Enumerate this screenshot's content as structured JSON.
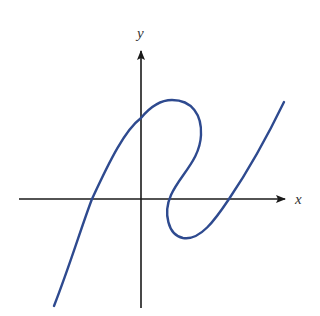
{
  "figure": {
    "x_axis_label": "x",
    "y_axis_label": "y",
    "axis_color": "#1a1a1a",
    "curve_color": "#2e4a8f"
  }
}
